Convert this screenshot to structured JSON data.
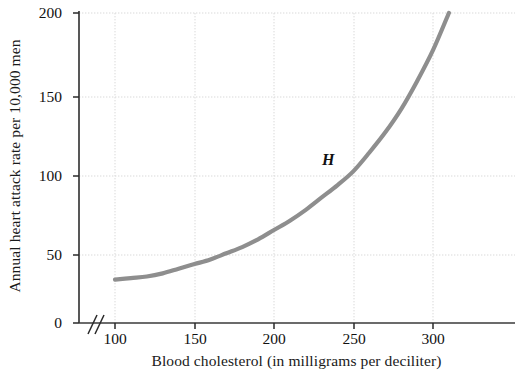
{
  "chart_data": {
    "type": "line",
    "title": "",
    "xlabel": "Blood cholesterol (in milligrams per deciliter)",
    "ylabel": "Annual heart attack rate per 10,000 men",
    "xlim": [
      100,
      340
    ],
    "ylim": [
      0,
      200
    ],
    "x_ticks": [
      100,
      150,
      200,
      250,
      300
    ],
    "y_ticks": [
      0,
      50,
      100,
      150,
      200
    ],
    "x_tick_labels": [
      "100",
      "150",
      "200",
      "250",
      "300"
    ],
    "y_tick_labels": [
      "0",
      "50",
      "100",
      "150",
      "200"
    ],
    "grid": true,
    "grid_style": "dotted",
    "legend": "none",
    "axis_break": {
      "axis": "x",
      "symbol": "//",
      "note": "break between 0 and 100 on horizontal axis"
    },
    "series": [
      {
        "name": "H",
        "label": "H",
        "color": "#8e8e8e",
        "annotation": "H",
        "x": [
          100,
          110,
          120,
          130,
          140,
          150,
          160,
          170,
          180,
          190,
          200,
          210,
          220,
          230,
          240,
          250,
          260,
          270,
          280,
          290,
          300,
          310
        ],
        "values": [
          28,
          29,
          30,
          32,
          35,
          38,
          41,
          45,
          49,
          54,
          60,
          66,
          73,
          81,
          89,
          98,
          110,
          123,
          138,
          156,
          176,
          200
        ]
      }
    ],
    "annotations": [
      {
        "text": "H",
        "x": 235,
        "y": 112
      }
    ],
    "colors": {
      "curve": "#8e8e8e",
      "axis": "#3a3a3a",
      "grid": "#d8d8d8",
      "text": "#111111",
      "background": "#ffffff"
    }
  },
  "axes": {
    "y_title": "Annual heart attack rate per 10,000 men",
    "x_title": "Blood cholesterol (in milligrams per deciliter)"
  },
  "ticks": {
    "y": [
      "200",
      "150",
      "100",
      "50",
      "0"
    ],
    "x": [
      "100",
      "150",
      "200",
      "250",
      "300"
    ]
  },
  "curve": {
    "label": "H"
  }
}
